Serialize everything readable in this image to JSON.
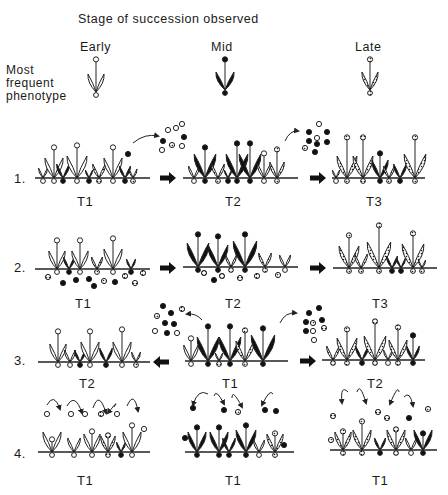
{
  "title": "Stage of succession observed",
  "stages": [
    {
      "label": "Early",
      "phenotype": "white"
    },
    {
      "label": "Mid",
      "phenotype": "black"
    },
    {
      "label": "Late",
      "phenotype": "hatched"
    }
  ],
  "phenotype_label": "Most\nfrequent\nphenotype",
  "rows": [
    {
      "label": "1.",
      "panels": [
        {
          "time": "T1"
        },
        {
          "time": "T2"
        },
        {
          "time": "T3"
        }
      ],
      "arrows": [
        "right",
        "right"
      ]
    },
    {
      "label": "2.",
      "panels": [
        {
          "time": "T1"
        },
        {
          "time": "T2"
        },
        {
          "time": "T3"
        }
      ],
      "arrows": [
        "right",
        "right"
      ]
    },
    {
      "label": "3.",
      "panels": [
        {
          "time": "T2"
        },
        {
          "time": "T1"
        },
        {
          "time": "T2"
        }
      ],
      "arrows": [
        "left",
        "right"
      ]
    },
    {
      "label": "4.",
      "panels": [
        {
          "time": "T1"
        },
        {
          "time": "T1"
        },
        {
          "time": "T1"
        }
      ],
      "arrows": []
    }
  ],
  "legend": {
    "white": "open circle seed / white outlined plant",
    "black": "solid seed / black plant",
    "hatched": "stippled seed / hatched plant"
  }
}
